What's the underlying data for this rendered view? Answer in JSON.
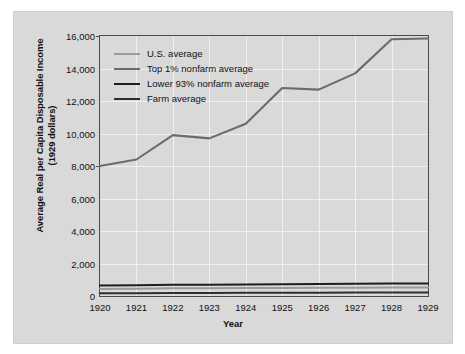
{
  "chart_data": {
    "type": "line",
    "title": "",
    "xlabel": "Year",
    "ylabel": "Average Real per Capita Disposable Income",
    "ylabel_line2": "(1929 dollars)",
    "x": [
      1920,
      1921,
      1922,
      1923,
      1924,
      1925,
      1926,
      1927,
      1928,
      1929
    ],
    "xticklabels": [
      "1920",
      "1921",
      "1922",
      "1923",
      "1924",
      "1925",
      "1926",
      "1927",
      "1928",
      "1929"
    ],
    "yticks": [
      0,
      2000,
      4000,
      6000,
      8000,
      10000,
      12000,
      14000,
      16000
    ],
    "yticklabels": [
      "0",
      "2,000",
      "4,000",
      "6,000",
      "8,000",
      "10,000",
      "12,000",
      "14,000",
      "16,000"
    ],
    "ylim": [
      0,
      16000
    ],
    "xlim": [
      1920,
      1929
    ],
    "grid": true,
    "legend_position": "upper left",
    "series": [
      {
        "name": "U.S. average",
        "color": "#9a9a9a",
        "values": [
          430,
          440,
          470,
          480,
          490,
          500,
          505,
          515,
          525,
          530
        ]
      },
      {
        "name": "Top 1% nonfarm average",
        "color": "#6b6b6b",
        "values": [
          8000,
          8400,
          9900,
          9700,
          10600,
          12800,
          12700,
          13700,
          15800,
          15850
        ]
      },
      {
        "name": "Lower 93% nonfarm average",
        "color": "#1e1e1e",
        "values": [
          640,
          660,
          690,
          700,
          710,
          730,
          740,
          755,
          770,
          775
        ]
      },
      {
        "name": "Farm average",
        "color": "#2e2e2e",
        "values": [
          170,
          175,
          180,
          190,
          195,
          200,
          205,
          210,
          215,
          215
        ]
      }
    ]
  }
}
